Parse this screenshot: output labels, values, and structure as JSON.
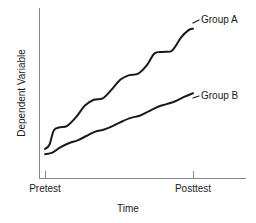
{
  "chart_data": {
    "type": "line",
    "title": "",
    "subtitle": "",
    "xlabel": "Time",
    "ylabel": "Dependent Variable",
    "x_tick_labels": [
      "Pretest",
      "Posttest"
    ],
    "x_tick_values": [
      0,
      1
    ],
    "y_tick_labels": [],
    "grid": false,
    "legend_position": "inline-right-end-labels",
    "xlim": [
      0,
      1
    ],
    "ylim": [
      0,
      1
    ],
    "annotations": [],
    "series": [
      {
        "name": "Group A",
        "label": "Group A",
        "color": "#1a1a1a",
        "x": [
          0.0,
          0.03,
          0.06,
          0.1,
          0.15,
          0.21,
          0.27,
          0.33,
          0.39,
          0.45,
          0.51,
          0.57,
          0.63,
          0.69,
          0.74,
          0.8,
          0.86,
          0.92,
          0.97,
          1.0
        ],
        "y": [
          0.11,
          0.14,
          0.24,
          0.26,
          0.27,
          0.33,
          0.41,
          0.45,
          0.46,
          0.52,
          0.59,
          0.62,
          0.63,
          0.69,
          0.77,
          0.78,
          0.79,
          0.88,
          0.93,
          0.94
        ]
      },
      {
        "name": "Group B",
        "label": "Group B",
        "color": "#1a1a1a",
        "x": [
          0.0,
          0.05,
          0.1,
          0.16,
          0.22,
          0.28,
          0.34,
          0.4,
          0.46,
          0.52,
          0.58,
          0.64,
          0.7,
          0.76,
          0.82,
          0.88,
          0.94,
          1.0
        ],
        "y": [
          0.075,
          0.085,
          0.12,
          0.15,
          0.17,
          0.2,
          0.23,
          0.245,
          0.27,
          0.3,
          0.325,
          0.34,
          0.37,
          0.4,
          0.42,
          0.44,
          0.47,
          0.495
        ]
      }
    ]
  },
  "axes": {
    "y_axis_name": "Dependent Variable",
    "x_axis_name": "Time"
  },
  "colors": {
    "line": "#1a1a1a",
    "axis": "#888888",
    "background": "#ffffff"
  }
}
